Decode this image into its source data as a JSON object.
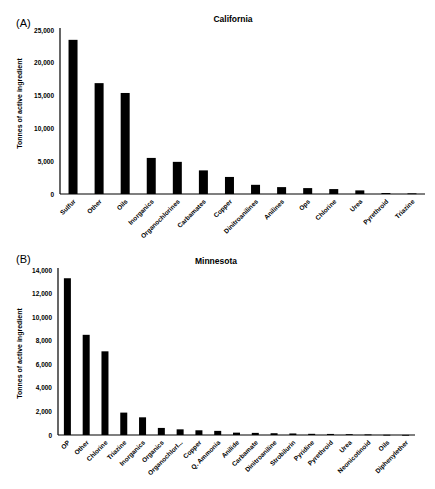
{
  "chart_data": [
    {
      "panel_label": "(A)",
      "type": "bar",
      "title": "California",
      "xlabel": "",
      "ylabel": "Tonnes of active ingredient",
      "ylim": [
        0,
        25000
      ],
      "yticks": [
        0,
        5000,
        10000,
        15000,
        20000,
        25000
      ],
      "ytick_labels": [
        "0",
        "5,000",
        "10,000",
        "15,000",
        "20,000",
        "25,000"
      ],
      "grid": false,
      "legend": null,
      "bar_color": "#000000",
      "categories": [
        "Sulfur",
        "Other",
        "Oils",
        "Inorganics",
        "Organochlorines",
        "Carbamates",
        "Copper",
        "Dinitroanilines",
        "Anilines",
        "Ops",
        "Chlorine",
        "Urea",
        "Pyrethroid",
        "Triazine"
      ],
      "values": [
        23500,
        16900,
        15400,
        5500,
        4900,
        3600,
        2600,
        1400,
        1050,
        900,
        750,
        550,
        150,
        100
      ]
    },
    {
      "panel_label": "(B)",
      "type": "bar",
      "title": "Minnesota",
      "xlabel": "",
      "ylabel": "Tonnes of active ingredient",
      "ylim": [
        0,
        14000
      ],
      "yticks": [
        0,
        2000,
        4000,
        6000,
        8000,
        10000,
        12000,
        14000
      ],
      "ytick_labels": [
        "0",
        "2,000",
        "4,000",
        "6,000",
        "8,000",
        "10,000",
        "12,000",
        "14,000"
      ],
      "grid": false,
      "legend": null,
      "bar_color": "#000000",
      "categories": [
        "OP",
        "Other",
        "Chlorine",
        "Triazine",
        "Inorganics",
        "Organics",
        "OrganochlorI...",
        "Copper",
        "Q. Ammonia",
        "Anilide",
        "Carbamate",
        "Dinitroaniline",
        "Strobilurin",
        "Pyridine",
        "Pyrethroid",
        "Urea",
        "Neonicotinoid",
        "Oils",
        "Diphenylether"
      ],
      "values": [
        13300,
        8500,
        7100,
        1900,
        1500,
        600,
        480,
        400,
        350,
        200,
        180,
        150,
        130,
        100,
        90,
        70,
        50,
        20,
        10
      ]
    }
  ]
}
